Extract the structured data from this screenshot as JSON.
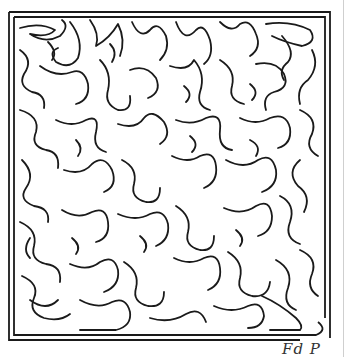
{
  "image": {
    "type": "hand-drawn maze puzzle",
    "colors": {
      "background": "#ffffff",
      "line": "#1a1a1a",
      "edge": "#cfcfcf"
    }
  },
  "maze": {
    "frame": {
      "outer": [
        9,
        12,
        330,
        340
      ],
      "inner": [
        14,
        17,
        325,
        335
      ]
    },
    "entrance": "top-left corridor",
    "exit": "bottom-right opening"
  },
  "signature": {
    "text": "Fd P"
  }
}
